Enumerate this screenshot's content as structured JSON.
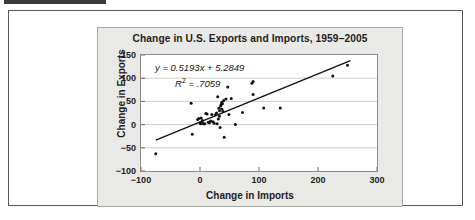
{
  "figure": {
    "top_bar_name": "header-rule"
  },
  "chart_data": {
    "type": "scatter",
    "title": "Change in U.S. Exports and Imports, 1959–2005",
    "xlabel": "Change in Imports",
    "ylabel": "Change in Exports",
    "xlim": [
      -100,
      300
    ],
    "ylim": [
      -100,
      150
    ],
    "xticks": [
      "−100",
      "0",
      "100",
      "200",
      "300"
    ],
    "xtick_values": [
      -100,
      0,
      100,
      200,
      300
    ],
    "yticks": [
      "150",
      "100",
      "50",
      "0",
      "−50",
      "−100"
    ],
    "ytick_values": [
      150,
      100,
      50,
      0,
      -50,
      -100
    ],
    "grid": "horizontal",
    "legend": "none",
    "annotations": {
      "equation": "y = 0.5193x + 5.2849",
      "equation_slope": 0.5193,
      "equation_intercept": 5.2849,
      "r_squared_label": "R",
      "r_squared_exponent": "2",
      "r_squared_value": "= .7059",
      "r_squared": 0.7059
    },
    "trendline": {
      "x_start": -75,
      "x_end": 255,
      "y_start": -33.66,
      "y_end": 137.7,
      "color": "#111111"
    },
    "marker_color": "#111111",
    "points": [
      [
        -75,
        -63
      ],
      [
        -15,
        46
      ],
      [
        -13,
        -21
      ],
      [
        -4,
        11
      ],
      [
        -2,
        13
      ],
      [
        0,
        4
      ],
      [
        1,
        2
      ],
      [
        2,
        14
      ],
      [
        3,
        3
      ],
      [
        4,
        9
      ],
      [
        6,
        2
      ],
      [
        8,
        2
      ],
      [
        10,
        24
      ],
      [
        12,
        23
      ],
      [
        14,
        5
      ],
      [
        16,
        4
      ],
      [
        18,
        8
      ],
      [
        20,
        22
      ],
      [
        22,
        6
      ],
      [
        24,
        3
      ],
      [
        26,
        21
      ],
      [
        28,
        25
      ],
      [
        29,
        2
      ],
      [
        30,
        60
      ],
      [
        31,
        12
      ],
      [
        32,
        35
      ],
      [
        33,
        18
      ],
      [
        33,
        30
      ],
      [
        34,
        -6
      ],
      [
        35,
        40
      ],
      [
        36,
        44
      ],
      [
        37,
        33
      ],
      [
        37,
        48
      ],
      [
        38,
        45
      ],
      [
        39,
        28
      ],
      [
        40,
        52
      ],
      [
        41,
        -27
      ],
      [
        44,
        55
      ],
      [
        47,
        81
      ],
      [
        49,
        22
      ],
      [
        53,
        56
      ],
      [
        60,
        0
      ],
      [
        72,
        26
      ],
      [
        88,
        89
      ],
      [
        90,
        93
      ],
      [
        90,
        65
      ],
      [
        108,
        36
      ],
      [
        136,
        36
      ],
      [
        225,
        105
      ],
      [
        250,
        128
      ]
    ]
  }
}
